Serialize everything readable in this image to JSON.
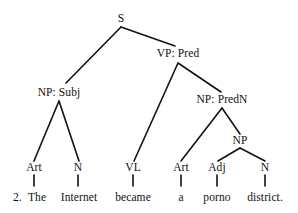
{
  "figure": {
    "type": "syntax-tree",
    "item_number": "2.",
    "sentence": "The Internet became a porno district.",
    "ink_color": "#111111",
    "background_color": "#ffffff"
  },
  "nodes": {
    "s": "S",
    "vp_pred": "VP: Pred",
    "np_subj": "NP: Subj",
    "np_predn": "NP: PredN",
    "np": "NP",
    "art1": "Art",
    "n1": "N",
    "vl": "VL",
    "art2": "Art",
    "adj": "Adj",
    "n2": "N"
  },
  "words": {
    "the": "The",
    "internet": "Internet",
    "became": "became",
    "a": "a",
    "porno": "porno",
    "district": "district."
  },
  "tree_data": {
    "type": "tree",
    "root": "S",
    "edges": [
      [
        "S",
        "NP: Subj"
      ],
      [
        "S",
        "VP: Pred"
      ],
      [
        "NP: Subj",
        "Art"
      ],
      [
        "NP: Subj",
        "N"
      ],
      [
        "VP: Pred",
        "VL"
      ],
      [
        "VP: Pred",
        "NP: PredN"
      ],
      [
        "NP: PredN",
        "Art"
      ],
      [
        "NP: PredN",
        "NP"
      ],
      [
        "NP",
        "Adj"
      ],
      [
        "NP",
        "N"
      ],
      [
        "Art",
        "The"
      ],
      [
        "N",
        "Internet"
      ],
      [
        "VL",
        "became"
      ],
      [
        "Art",
        "a"
      ],
      [
        "Adj",
        "porno"
      ],
      [
        "N",
        "district."
      ]
    ]
  }
}
